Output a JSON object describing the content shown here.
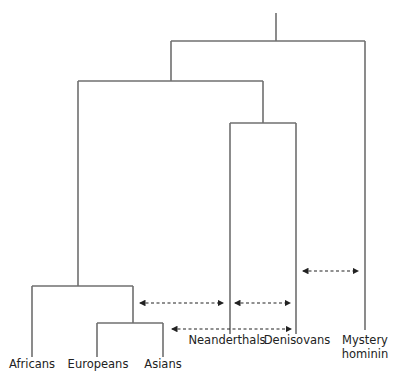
{
  "diagram": {
    "type": "phylogenetic-tree",
    "colors": {
      "branch": "#6f6f6f",
      "gene_flow_arrow": "#222222",
      "label": "#222222"
    },
    "taxa": [
      {
        "id": "africans",
        "label": "Africans"
      },
      {
        "id": "europeans",
        "label": "Europeans"
      },
      {
        "id": "asians",
        "label": "Asians"
      },
      {
        "id": "neanderthals",
        "label": "Neanderthals"
      },
      {
        "id": "denisovans",
        "label": "Denisovans"
      },
      {
        "id": "mystery",
        "label_line1": "Mystery",
        "label_line2": "hominin"
      }
    ],
    "gene_flow": [
      {
        "from": "neanderthals",
        "to": "humans (Europeans+Asians)",
        "bidirectional": true
      },
      {
        "from": "neanderthals",
        "to": "denisovans",
        "bidirectional": true
      },
      {
        "from": "denisovans",
        "to": "asians",
        "bidirectional": true
      },
      {
        "from": "mystery",
        "to": "denisovans",
        "bidirectional": true
      }
    ]
  }
}
